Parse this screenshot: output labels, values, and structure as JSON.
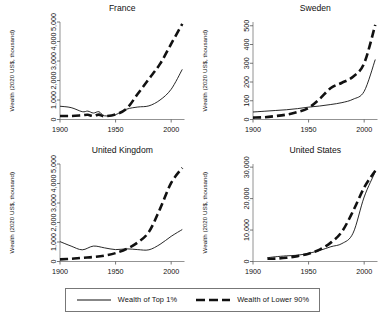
{
  "figure": {
    "panel_order": [
      "france",
      "sweden",
      "united_kingdom",
      "united_states"
    ]
  },
  "legend": {
    "entries": [
      {
        "label": "Wealth of Top 1%",
        "style": "solid",
        "color": "#111111"
      },
      {
        "label": "Wealth of Lower 90%",
        "style": "dashed",
        "color": "#111111"
      }
    ]
  },
  "chart_data": [
    {
      "type": "line",
      "id": "france",
      "title": "France",
      "xlabel": "",
      "ylabel": "Wealth (2020 US$, thousand)",
      "xlim": [
        1900,
        2012
      ],
      "ylim": [
        0,
        5000
      ],
      "xticks": [
        1900,
        1950,
        2000
      ],
      "xticklabels": [
        "1900",
        "1950",
        "2000"
      ],
      "yticks": [
        0,
        1000,
        2000,
        3000,
        4000,
        5000
      ],
      "yticklabels": [
        "0",
        "1,000",
        "2,000",
        "3,000",
        "4,000",
        "5,000"
      ],
      "grid": false,
      "legend_position": "below-figure",
      "x": [
        1900,
        1910,
        1920,
        1925,
        1930,
        1935,
        1940,
        1950,
        1960,
        1970,
        1980,
        1990,
        2000,
        2010
      ],
      "series": [
        {
          "name": "Wealth of Top 1%",
          "style": "solid",
          "values": [
            680,
            610,
            400,
            430,
            330,
            400,
            190,
            250,
            530,
            640,
            700,
            1000,
            1550,
            2570
          ]
        },
        {
          "name": "Wealth of Lower 90%",
          "style": "dashed",
          "values": [
            180,
            180,
            220,
            240,
            180,
            250,
            170,
            260,
            560,
            1320,
            2080,
            2850,
            3880,
            4900
          ]
        }
      ]
    },
    {
      "type": "line",
      "id": "sweden",
      "title": "Sweden",
      "xlabel": "",
      "ylabel": "Wealth (2020 US$, thousand)",
      "xlim": [
        1900,
        2012
      ],
      "ylim": [
        0,
        520
      ],
      "xticks": [
        1900,
        1950,
        2000
      ],
      "xticklabels": [
        "1900",
        "1950",
        "2000"
      ],
      "yticks": [
        0,
        100,
        200,
        300,
        400,
        500
      ],
      "yticklabels": [
        "0",
        "100",
        "200",
        "300",
        "400",
        "500"
      ],
      "grid": false,
      "legend_position": "below-figure",
      "x": [
        1900,
        1910,
        1920,
        1930,
        1940,
        1950,
        1960,
        1970,
        1980,
        1990,
        2000,
        2010
      ],
      "series": [
        {
          "name": "Wealth of Top 1%",
          "style": "solid",
          "values": [
            40,
            44,
            48,
            52,
            58,
            66,
            72,
            80,
            90,
            108,
            150,
            320
          ]
        },
        {
          "name": "Wealth of Lower 90%",
          "style": "dashed",
          "values": [
            10,
            12,
            18,
            26,
            40,
            62,
            110,
            168,
            196,
            228,
            300,
            505
          ]
        }
      ]
    },
    {
      "type": "line",
      "id": "united_kingdom",
      "title": "United Kingdom",
      "xlabel": "",
      "ylabel": "Wealth (2020 US$, thousand)",
      "xlim": [
        1900,
        2012
      ],
      "ylim": [
        0,
        5000
      ],
      "xticks": [
        1900,
        1950,
        2000
      ],
      "xticklabels": [
        "1900",
        "1950",
        "2000"
      ],
      "yticks": [
        0,
        1000,
        2000,
        3000,
        4000,
        5000
      ],
      "yticklabels": [
        "0",
        "1,000",
        "2,000",
        "3,000",
        "4,000",
        "5,000"
      ],
      "grid": false,
      "legend_position": "below-figure",
      "x": [
        1900,
        1910,
        1920,
        1930,
        1940,
        1950,
        1960,
        1970,
        1980,
        1990,
        2000,
        2010
      ],
      "series": [
        {
          "name": "Wealth of Top 1%",
          "style": "solid",
          "values": [
            1020,
            790,
            600,
            790,
            700,
            610,
            650,
            610,
            600,
            880,
            1290,
            1640
          ]
        },
        {
          "name": "Wealth of Lower 90%",
          "style": "dashed",
          "values": [
            110,
            140,
            190,
            230,
            300,
            430,
            650,
            980,
            1520,
            2700,
            4030,
            4800
          ]
        }
      ]
    },
    {
      "type": "line",
      "id": "united_states",
      "title": "United States",
      "xlabel": "",
      "ylabel": "Wealth (2020 US$, thousand)",
      "xlim": [
        1900,
        2012
      ],
      "ylim": [
        0,
        31000
      ],
      "xticks": [
        1900,
        1950,
        2000
      ],
      "xticklabels": [
        "1900",
        "1950",
        "2000"
      ],
      "yticks": [
        0,
        10000,
        20000,
        30000
      ],
      "yticklabels": [
        "0",
        "10,000",
        "20,000",
        "30,000"
      ],
      "grid": false,
      "legend_position": "below-figure",
      "x": [
        1913,
        1920,
        1930,
        1940,
        1950,
        1960,
        1970,
        1980,
        1990,
        2000,
        2010
      ],
      "series": [
        {
          "name": "Wealth of Top 1%",
          "style": "solid",
          "values": [
            1200,
            1500,
            1800,
            2000,
            2600,
            3500,
            4700,
            5700,
            9000,
            20500,
            28500
          ]
        },
        {
          "name": "Wealth of Lower 90%",
          "style": "dashed",
          "values": [
            900,
            900,
            1200,
            1700,
            2500,
            3800,
            6000,
            9500,
            16000,
            23500,
            28900
          ]
        }
      ]
    }
  ]
}
